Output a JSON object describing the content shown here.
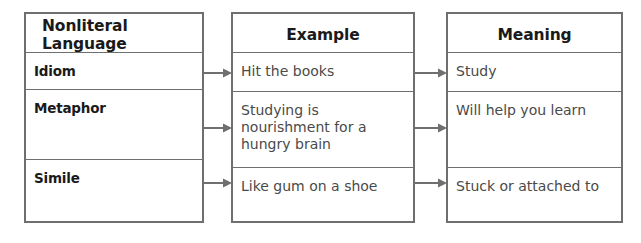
{
  "diagram": {
    "stroke_color": "#6f6f6f",
    "header_text_color": "#1a1a1a",
    "body_text_color": "#4a4a4a",
    "background_color": "#ffffff"
  },
  "columns": [
    {
      "id": "language",
      "header": "Nonliteral Language",
      "header_align": "left",
      "cells": [
        {
          "text": "Idiom",
          "style": "term"
        },
        {
          "text": "Metaphor",
          "style": "term"
        },
        {
          "text": "Simile",
          "style": "term"
        }
      ]
    },
    {
      "id": "example",
      "header": "Example",
      "header_align": "center",
      "cells": [
        {
          "text": "Hit the books",
          "style": "body"
        },
        {
          "text": "Studying is nourishment for a hungry brain",
          "style": "body"
        },
        {
          "text": "Like gum on a shoe",
          "style": "body"
        }
      ]
    },
    {
      "id": "meaning",
      "header": "Meaning",
      "header_align": "center",
      "cells": [
        {
          "text": "Study",
          "style": "body"
        },
        {
          "text": "Will help you learn",
          "style": "body"
        },
        {
          "text": "Stuck or attached to",
          "style": "body"
        }
      ]
    }
  ],
  "arrows": [
    {
      "name": "arrow-idiom-to-example",
      "from": "language",
      "to": "example"
    },
    {
      "name": "arrow-metaphor-to-example",
      "from": "language",
      "to": "example"
    },
    {
      "name": "arrow-simile-to-example",
      "from": "language",
      "to": "example"
    },
    {
      "name": "arrow-example-to-meaning-1",
      "from": "example",
      "to": "meaning"
    },
    {
      "name": "arrow-example-to-meaning-2",
      "from": "example",
      "to": "meaning"
    },
    {
      "name": "arrow-example-to-meaning-3",
      "from": "example",
      "to": "meaning"
    }
  ]
}
